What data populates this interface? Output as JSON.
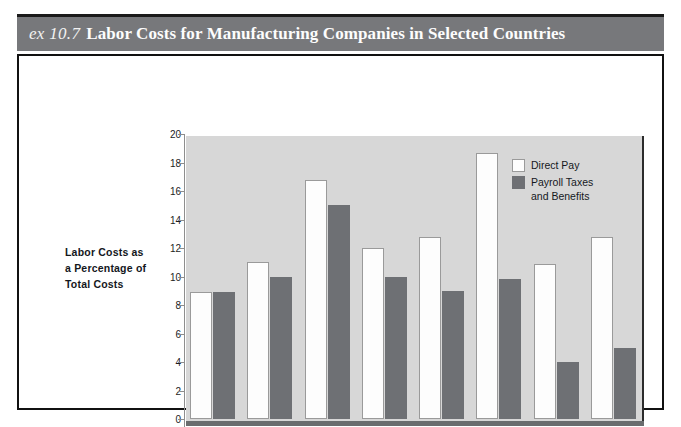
{
  "figure": {
    "exhibit_prefix": "ex 10.7",
    "title": "Labor Costs for Manufacturing Companies in Selected Countries",
    "title_bar_color": "#77787b",
    "plot_background_color": "#d7d7d7",
    "frame_border_color": "#111111"
  },
  "chart_data": {
    "type": "bar",
    "title": "Labor Costs for Manufacturing Companies in Selected Countries",
    "xlabel": "",
    "ylabel": "Labor Costs as a Percentage of Total Costs",
    "ylabel_lines": [
      "Labor Costs as",
      "a Percentage of",
      "Total Costs"
    ],
    "categories": [
      "Italy",
      "France",
      "Western Germany",
      "Eastern Germany",
      "Japan",
      "Switzerland",
      "Britain",
      "United States"
    ],
    "category_lines": [
      [
        "Italy"
      ],
      [
        "France"
      ],
      [
        "Western",
        "Germany"
      ],
      [
        "Eastern",
        "Germany"
      ],
      [
        "Japan"
      ],
      [
        "Switzerland"
      ],
      [
        "Britain"
      ],
      [
        "United",
        "States"
      ]
    ],
    "series": [
      {
        "name": "Direct Pay",
        "color": "#fdfdfd",
        "values": [
          8.9,
          11.0,
          16.8,
          12.0,
          12.8,
          18.7,
          10.9,
          12.8
        ]
      },
      {
        "name": "Payroll Taxes and Benefits",
        "color": "#6e7074",
        "values": [
          8.9,
          10.0,
          15.0,
          10.0,
          9.0,
          9.8,
          4.0,
          5.0
        ]
      }
    ],
    "ylim": [
      0,
      20
    ],
    "yticks": [
      0,
      2,
      4,
      6,
      8,
      10,
      12,
      14,
      16,
      18,
      20
    ],
    "ytick_labels": [
      "0",
      "2",
      "4",
      "6",
      "8",
      "10",
      "12",
      "14",
      "16",
      "18",
      "20"
    ],
    "grid": false,
    "legend_position": "upper right",
    "legend": [
      {
        "label": "Direct Pay",
        "lines": [
          "Direct Pay"
        ],
        "color": "#fdfdfd"
      },
      {
        "label": "Payroll Taxes and Benefits",
        "lines": [
          "Payroll Taxes",
          "and Benefits"
        ],
        "color": "#6e7074"
      }
    ]
  }
}
